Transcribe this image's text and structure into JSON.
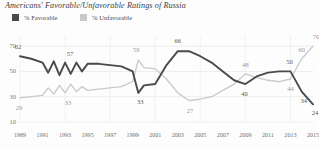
{
  "title": "Americans' Favorable/Unfavorable Ratings of Russia",
  "legend": {
    "favorable": "% Favorable",
    "unfavorable": "% Unfavorable",
    "favorable_color": "#4a4a4a",
    "unfavorable_color": "#c9c9c9"
  },
  "axis": {
    "y_ticks": [
      "70",
      "50",
      "30",
      "10"
    ],
    "x_ticks": [
      "1989",
      "1991",
      "1993",
      "1995",
      "1997",
      "1999",
      "2001",
      "2003",
      "2005",
      "2007",
      "2009",
      "2011",
      "2013",
      "2015"
    ]
  },
  "data_labels": {
    "favorable": [
      "62",
      "57",
      "33",
      "66",
      "40",
      "50",
      "34",
      "24"
    ],
    "unfavorable": [
      "29",
      "33",
      "59",
      "27",
      "48",
      "44",
      "60",
      "70"
    ]
  },
  "chart_data": {
    "type": "line",
    "title": "Americans' Favorable/Unfavorable Ratings of Russia",
    "xlabel": "",
    "ylabel": "",
    "ylim": [
      10,
      78
    ],
    "xlim": [
      1989,
      2015
    ],
    "grid": true,
    "legend_position": "top-left",
    "x": [
      1989,
      1990,
      1991,
      1991.5,
      1992,
      1992.5,
      1993,
      1993.5,
      1994,
      1994.5,
      1995,
      1996,
      1997,
      1998,
      1999,
      1999.5,
      2000,
      2001,
      2002,
      2003,
      2004,
      2005,
      2006,
      2007,
      2008,
      2009,
      2010,
      2011,
      2012,
      2013,
      2014,
      2015
    ],
    "series": [
      {
        "name": "% Favorable",
        "color": "#4a4a4a",
        "values": [
          62,
          60,
          57,
          49,
          58,
          47,
          57,
          48,
          57,
          50,
          56,
          56,
          55,
          54,
          50,
          33,
          39,
          40,
          55,
          66,
          66,
          62,
          57,
          50,
          43,
          40,
          46,
          49,
          50,
          50,
          34,
          24
        ]
      },
      {
        "name": "% Unfavorable",
        "color": "#c9c9c9",
        "values": [
          29,
          30,
          31,
          37,
          32,
          39,
          33,
          40,
          34,
          38,
          35,
          36,
          37,
          38,
          42,
          59,
          53,
          52,
          44,
          33,
          27,
          28,
          30,
          35,
          40,
          48,
          45,
          43,
          42,
          44,
          60,
          70
        ]
      }
    ],
    "annotations": [
      {
        "series": "% Favorable",
        "label": "62",
        "x": 1989
      },
      {
        "series": "% Favorable",
        "label": "57",
        "x": 1993
      },
      {
        "series": "% Favorable",
        "label": "33",
        "x": 1999.5
      },
      {
        "series": "% Favorable",
        "label": "66",
        "x": 2003
      },
      {
        "series": "% Favorable",
        "label": "40",
        "x": 2009
      },
      {
        "series": "% Favorable",
        "label": "50",
        "x": 2013
      },
      {
        "series": "% Favorable",
        "label": "34",
        "x": 2014
      },
      {
        "series": "% Favorable",
        "label": "24",
        "x": 2015
      },
      {
        "series": "% Unfavorable",
        "label": "29",
        "x": 1989
      },
      {
        "series": "% Unfavorable",
        "label": "33",
        "x": 1993
      },
      {
        "series": "% Unfavorable",
        "label": "59",
        "x": 1999.5
      },
      {
        "series": "% Unfavorable",
        "label": "27",
        "x": 2004
      },
      {
        "series": "% Unfavorable",
        "label": "48",
        "x": 2009
      },
      {
        "series": "% Unfavorable",
        "label": "44",
        "x": 2013
      },
      {
        "series": "% Unfavorable",
        "label": "60",
        "x": 2014
      },
      {
        "series": "% Unfavorable",
        "label": "70",
        "x": 2015
      }
    ]
  }
}
